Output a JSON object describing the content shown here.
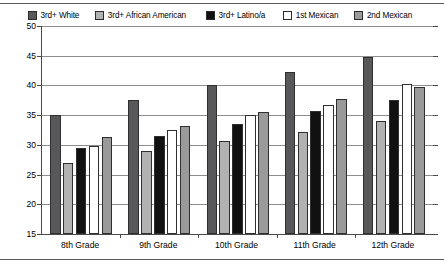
{
  "chart_data": {
    "type": "bar",
    "title": "",
    "xlabel": "",
    "ylabel": "",
    "ylim": [
      15,
      50
    ],
    "ytick_step": 5,
    "yticks": [
      15,
      20,
      25,
      30,
      35,
      40,
      45,
      50
    ],
    "grid": true,
    "legend_position": "top",
    "categories": [
      "8th Grade",
      "9th Grade",
      "10th Grade",
      "11th Grade",
      "12th Grade"
    ],
    "series": [
      {
        "name": "3rd+ White",
        "color": "#58585a",
        "values": [
          35.0,
          37.5,
          40.0,
          42.3,
          44.8
        ]
      },
      {
        "name": "3rd+ African American",
        "color": "#b2b2b2",
        "values": [
          27.0,
          29.0,
          30.7,
          32.2,
          34.0
        ]
      },
      {
        "name": "3rd+ Latino/a",
        "color": "#111111",
        "values": [
          29.5,
          31.5,
          33.5,
          35.7,
          37.5
        ]
      },
      {
        "name": "1st Mexican",
        "color": "#ffffff",
        "values": [
          29.8,
          32.5,
          35.0,
          36.7,
          40.3
        ]
      },
      {
        "name": "2nd Mexican",
        "color": "#9a9a9a",
        "values": [
          31.3,
          33.2,
          35.6,
          37.8,
          39.8
        ]
      }
    ]
  }
}
